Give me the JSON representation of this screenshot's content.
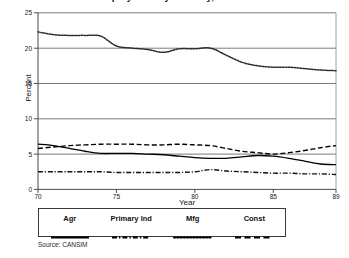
{
  "chart_data": {
    "type": "line",
    "title": "Employment by Industry, Canada",
    "xlabel": "Year",
    "ylabel": "Percent",
    "xlim": [
      70,
      89
    ],
    "ylim": [
      0,
      25
    ],
    "yticks": [
      0,
      5,
      10,
      15,
      20,
      25
    ],
    "xticks": [
      70,
      75,
      80,
      85,
      89
    ],
    "grid": "horizontal",
    "legend_position": "below-plot",
    "source": "Source: CANSIM",
    "x": [
      70,
      71,
      72,
      73,
      74,
      75,
      76,
      77,
      78,
      79,
      80,
      81,
      82,
      83,
      84,
      85,
      86,
      87,
      88,
      89
    ],
    "series": [
      {
        "name": "Agr",
        "style": "solid",
        "color": "#000000",
        "values": [
          6.4,
          6.2,
          5.8,
          5.4,
          5.1,
          5.1,
          5.1,
          5.0,
          4.9,
          4.7,
          4.5,
          4.4,
          4.4,
          4.6,
          4.8,
          4.7,
          4.4,
          4.0,
          3.6,
          3.5
        ]
      },
      {
        "name": "Primary Ind",
        "style": "dash-dot",
        "color": "#111111",
        "values": [
          2.5,
          2.5,
          2.5,
          2.5,
          2.5,
          2.4,
          2.4,
          2.4,
          2.4,
          2.4,
          2.5,
          2.8,
          2.6,
          2.5,
          2.4,
          2.3,
          2.3,
          2.2,
          2.2,
          2.1
        ]
      },
      {
        "name": "Mfg",
        "style": "dotted",
        "color": "#2a2a2a",
        "values": [
          22.3,
          21.9,
          21.8,
          21.8,
          21.7,
          20.3,
          20.0,
          19.8,
          19.4,
          19.9,
          19.9,
          20.0,
          19.0,
          18.0,
          17.5,
          17.3,
          17.3,
          17.1,
          16.9,
          16.8
        ]
      },
      {
        "name": "Const",
        "style": "dashed",
        "color": "#000000",
        "values": [
          5.8,
          6.0,
          6.2,
          6.3,
          6.4,
          6.4,
          6.4,
          6.3,
          6.3,
          6.4,
          6.3,
          6.2,
          5.8,
          5.4,
          5.2,
          5.0,
          5.2,
          5.5,
          5.9,
          6.2
        ]
      }
    ]
  },
  "axes": {
    "ylabel": "Percent",
    "xlabel": "Year",
    "yticks": [
      "0",
      "5",
      "10",
      "15",
      "20",
      "25"
    ],
    "xticks": [
      "70",
      "75",
      "80",
      "85",
      "89"
    ]
  },
  "legend": {
    "items": [
      {
        "label": "Agr",
        "style": "solid"
      },
      {
        "label": "Primary Ind",
        "style": "dash-dot"
      },
      {
        "label": "Mfg",
        "style": "dotted"
      },
      {
        "label": "Const",
        "style": "dashed"
      }
    ]
  },
  "footer": {
    "source": "Source: CANSIM"
  },
  "header": {
    "title": "Employment by Industry, Canada"
  }
}
